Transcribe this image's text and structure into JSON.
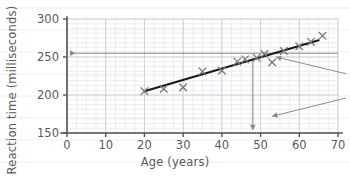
{
  "chart_data": {
    "type": "scatter",
    "title": "",
    "xlabel": "Age (years)",
    "ylabel": "Reaction time (milliseconds)",
    "xlim": [
      0,
      70
    ],
    "ylim": [
      150,
      300
    ],
    "xticks": [
      0,
      10,
      20,
      30,
      40,
      50,
      60,
      70
    ],
    "yticks": [
      150,
      200,
      250,
      300
    ],
    "xtick_labels": [
      "0",
      "10",
      "20",
      "30",
      "40",
      "50",
      "60",
      "70"
    ],
    "ytick_labels": [
      "150",
      "200",
      "250",
      "300"
    ],
    "grid": true,
    "grid_minor_step_x": 2.5,
    "grid_minor_step_y": 6.25,
    "legend": "none",
    "marker": "x",
    "marker_color": "#7a7a7a",
    "points": [
      {
        "x": 20,
        "y": 205
      },
      {
        "x": 25,
        "y": 208
      },
      {
        "x": 30,
        "y": 210
      },
      {
        "x": 35,
        "y": 231
      },
      {
        "x": 40,
        "y": 232
      },
      {
        "x": 44,
        "y": 244
      },
      {
        "x": 46,
        "y": 247
      },
      {
        "x": 49,
        "y": 249
      },
      {
        "x": 51,
        "y": 254
      },
      {
        "x": 53,
        "y": 243
      },
      {
        "x": 56,
        "y": 258
      },
      {
        "x": 60,
        "y": 264
      },
      {
        "x": 63,
        "y": 270
      },
      {
        "x": 66,
        "y": 278
      }
    ],
    "trend_line": {
      "label": "line of best fit",
      "color": "#1a1a1a",
      "x_start": 20,
      "x_end": 65,
      "y_start": 205,
      "y_end": 272
    },
    "annotations": [
      {
        "name": "horizontal-reading-line",
        "type": "arrow-line",
        "orientation": "horizontal",
        "y_value": 255,
        "x_from": 70,
        "x_to": 0,
        "color": "#8c8c8c",
        "arrow_at": "left"
      },
      {
        "name": "vertical-reading-line",
        "type": "arrow-line",
        "orientation": "vertical",
        "x_value": 48,
        "y_from": 245,
        "y_to": 150,
        "color": "#8c8c8c",
        "arrow_at": "bottom"
      },
      {
        "name": "pointer-arrow-to-trend-line",
        "type": "diagonal-arrow",
        "color": "#8c8c8c",
        "from_x": 70,
        "from_y": 228,
        "to_x": 54,
        "to_y": 250
      },
      {
        "name": "pointer-arrow-to-axis",
        "type": "diagonal-arrow",
        "color": "#8c8c8c",
        "from_x": 70,
        "from_y": 196,
        "to_x": 53,
        "to_y": 172
      }
    ]
  },
  "axes": {
    "x_label": "Age (years)",
    "y_label": "Reaction time (milliseconds)",
    "x_ticks": [
      "0",
      "10",
      "20",
      "30",
      "40",
      "50",
      "60",
      "70"
    ],
    "y_ticks": [
      "300",
      "250",
      "200",
      "150"
    ]
  },
  "colors": {
    "background": "#ffffff",
    "axis": "#555555",
    "grid_major": "#c9cdd6",
    "grid_minor": "#e4e7ec",
    "marker": "#7a7a7a",
    "trend": "#1a1a1a",
    "annotation": "#8c8c8c",
    "text": "#5a5a5a",
    "page_rule": "#eceff3"
  }
}
